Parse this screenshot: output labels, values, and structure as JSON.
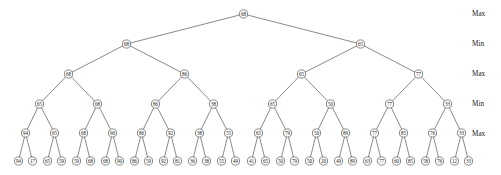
{
  "diagram": {
    "type": "game-tree",
    "node_radius": 4.1,
    "leaf_radius": 4.1,
    "stroke_color": "#3a3a3a",
    "node_fill": "#ffffff",
    "text_color": "#1a1a1a",
    "background": "#ffffff",
    "level_labels": [
      {
        "text": "Max",
        "x": 472,
        "y": 14
      },
      {
        "text": "Min",
        "x": 472,
        "y": 44
      },
      {
        "text": "Max",
        "x": 472,
        "y": 74
      },
      {
        "text": "Min",
        "x": 472,
        "y": 104
      },
      {
        "text": "Max",
        "x": 472,
        "y": 134
      }
    ],
    "levels": [
      {
        "depth": 0,
        "role": "Max",
        "y": 14,
        "values": [
          68
        ],
        "x": [
          243.5
        ]
      },
      {
        "depth": 1,
        "role": "Min",
        "y": 44,
        "values": [
          68,
          65
        ],
        "x": [
          126.5,
          360.5
        ]
      },
      {
        "depth": 2,
        "role": "Max",
        "y": 74,
        "values": [
          68,
          86,
          65,
          77
        ],
        "x": [
          68.5,
          184.5,
          301.5,
          418.5
        ]
      },
      {
        "depth": 3,
        "role": "Min",
        "y": 104,
        "values": [
          65,
          68,
          86,
          38,
          65,
          50,
          77,
          33
        ],
        "x": [
          39.5,
          97.5,
          155.5,
          213.5,
          272.5,
          330.5,
          389.5,
          447.5
        ]
      },
      {
        "depth": 4,
        "role": "Max",
        "y": 133,
        "values": [
          94,
          65,
          68,
          90,
          86,
          92,
          38,
          55,
          65,
          79,
          50,
          89,
          77,
          85,
          76,
          33
        ],
        "x": [
          25.5,
          54.5,
          83.5,
          112.5,
          141.5,
          170.5,
          199.5,
          228.5,
          258.5,
          287.5,
          316.5,
          345.5,
          374.5,
          403.5,
          432.5,
          461.5
        ]
      },
      {
        "depth": 5,
        "role": "leaf",
        "y": 161,
        "values": [
          94,
          17,
          65,
          59,
          59,
          68,
          68,
          90,
          86,
          59,
          92,
          81,
          36,
          38,
          55,
          49,
          41,
          65,
          50,
          79,
          50,
          20,
          49,
          89,
          63,
          77,
          60,
          85,
          58,
          76,
          12,
          33
        ],
        "x": [
          18.5,
          32.5,
          47.5,
          61.5,
          76.5,
          90.5,
          105.5,
          119.5,
          134.5,
          148.5,
          163.5,
          177.5,
          192.5,
          206.5,
          221.5,
          235.5,
          251.5,
          265.5,
          280.5,
          294.5,
          309.5,
          323.5,
          338.5,
          352.5,
          367.5,
          381.5,
          396.5,
          410.5,
          425.5,
          439.5,
          454.5,
          468.5
        ]
      }
    ]
  }
}
